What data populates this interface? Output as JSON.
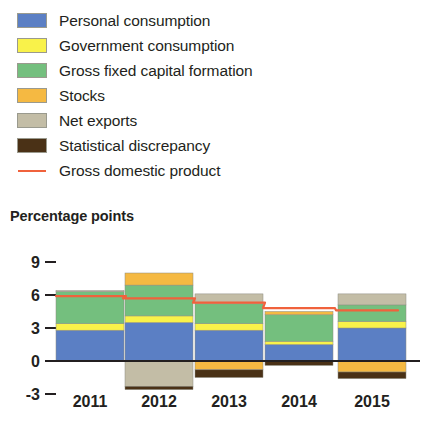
{
  "legend": {
    "items": [
      {
        "label": "Personal consumption",
        "color": "#5b7fc4",
        "marker": "swatch",
        "key": "personal_consumption"
      },
      {
        "label": "Government consumption",
        "color": "#f9f24a",
        "marker": "swatch",
        "key": "government_consumption"
      },
      {
        "label": "Gross fixed capital formation",
        "color": "#74bf7e",
        "marker": "swatch",
        "key": "gross_fixed_capital_formation"
      },
      {
        "label": "Stocks",
        "color": "#f5b942",
        "marker": "swatch",
        "key": "stocks"
      },
      {
        "label": "Net exports",
        "color": "#c3bda6",
        "marker": "swatch",
        "key": "net_exports"
      },
      {
        "label": "Statistical discrepancy",
        "color": "#4a3116",
        "marker": "swatch",
        "key": "statistical_discrepancy"
      },
      {
        "label": "Gross domestic product",
        "color": "#f0623c",
        "marker": "line",
        "key": "gross_domestic_product"
      }
    ]
  },
  "axis_title": "Percentage points",
  "chart_data": {
    "type": "bar",
    "title": "",
    "subtitle": "",
    "xlabel": "",
    "ylabel": "Percentage points",
    "stacked": true,
    "grid": false,
    "legend_position": "top-left",
    "categories": [
      "2011",
      "2012",
      "2013",
      "2014",
      "2015"
    ],
    "ylim": [
      -3,
      9
    ],
    "yticks": [
      9,
      6,
      3,
      0,
      -3
    ],
    "ytick_labels": [
      "9",
      "6",
      "3",
      "0",
      "-3"
    ],
    "series": [
      {
        "name": "Personal consumption",
        "color": "#5b7fc4",
        "values": [
          2.8,
          3.5,
          2.8,
          1.5,
          3.0
        ]
      },
      {
        "name": "Government consumption",
        "color": "#f9f24a",
        "values": [
          0.6,
          0.6,
          0.6,
          0.3,
          0.6
        ]
      },
      {
        "name": "Gross fixed capital formation",
        "color": "#74bf7e",
        "values": [
          2.9,
          2.8,
          1.8,
          2.4,
          1.5
        ]
      },
      {
        "name": "Stocks",
        "color": "#f5b942",
        "values": [
          0.0,
          1.1,
          -0.8,
          0.3,
          -1.0
        ]
      },
      {
        "name": "Net exports",
        "color": "#c3bda6",
        "values": [
          0.1,
          -2.3,
          0.9,
          0.0,
          1.0
        ]
      },
      {
        "name": "Statistical discrepancy",
        "color": "#4a3116",
        "values": [
          0.0,
          -0.3,
          -0.7,
          -0.4,
          -0.6
        ]
      }
    ],
    "line_series": {
      "name": "Gross domestic product",
      "color": "#f0623c",
      "values": [
        5.9,
        5.7,
        5.3,
        4.8,
        4.6
      ]
    }
  }
}
